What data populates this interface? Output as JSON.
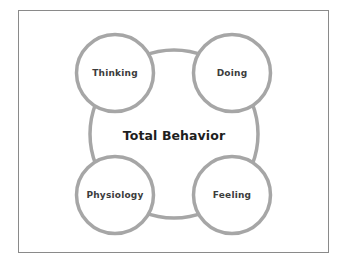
{
  "diagram": {
    "title": "Total Behavior",
    "components": [
      {
        "label": "Thinking",
        "position": "top-left"
      },
      {
        "label": "Doing",
        "position": "top-right"
      },
      {
        "label": "Physiology",
        "position": "bottom-left"
      },
      {
        "label": "Feeling",
        "position": "bottom-right"
      }
    ],
    "colors": {
      "stroke": "#a6a6a6",
      "frame": "#8a8a8a",
      "text": "#3c3c3c",
      "center_text": "#1e1e1e",
      "background": "#ffffff"
    }
  }
}
